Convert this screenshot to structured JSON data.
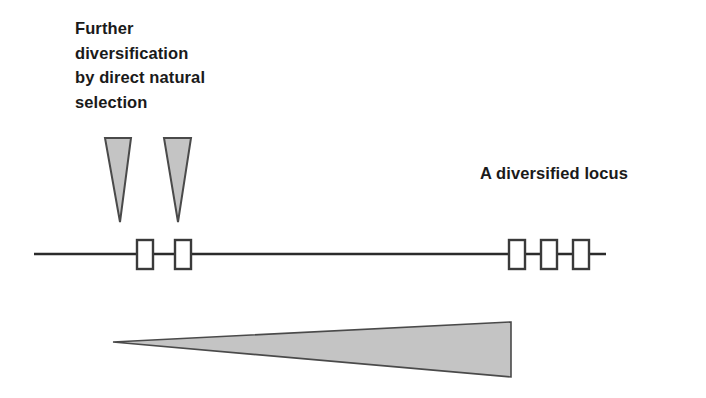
{
  "figure": {
    "width": 706,
    "height": 398,
    "background_color": "#ffffff",
    "type": "schematic-diagram"
  },
  "labels": {
    "left_caption": "Further\ndiversification\nby direct natural\nselection",
    "left_caption_lines": [
      "Further",
      "diversification",
      "by direct natural",
      "selection"
    ],
    "right_caption": "A diversified locus"
  },
  "colors": {
    "text": "#1a1a1a",
    "line": "#2b2b2b",
    "triangle_fill": "#c4c4c4",
    "triangle_stroke": "#4a4a4a",
    "box_fill": "#ffffff",
    "box_stroke": "#3a3a3a"
  },
  "diagram": {
    "chromosome_line": {
      "x1": 34,
      "x2": 606,
      "y": 254,
      "stroke_width": 2.6
    },
    "gene_boxes": [
      {
        "name": "locus-box-left-1",
        "x": 137,
        "y": 240,
        "width": 16,
        "height": 29
      },
      {
        "name": "locus-box-left-2",
        "x": 175,
        "y": 240,
        "width": 16,
        "height": 29
      },
      {
        "name": "locus-box-right-1",
        "x": 509,
        "y": 240,
        "width": 16,
        "height": 29
      },
      {
        "name": "locus-box-right-2",
        "x": 541,
        "y": 240,
        "width": 16,
        "height": 29
      },
      {
        "name": "locus-box-right-3",
        "x": 573,
        "y": 240,
        "width": 16,
        "height": 29
      }
    ],
    "selection_arrows": [
      {
        "name": "selection-triangle-1",
        "top_left_x": 105,
        "top_right_x": 131,
        "top_y": 138,
        "tip_x": 120,
        "tip_y": 222
      },
      {
        "name": "selection-triangle-2",
        "top_left_x": 164,
        "top_right_x": 191,
        "top_y": 138,
        "tip_x": 178,
        "tip_y": 222
      }
    ],
    "divergence_wedge": {
      "name": "divergence-wedge",
      "apex_x": 113,
      "apex_y": 342,
      "base_x": 511,
      "base_top_y": 322,
      "base_bottom_y": 377
    }
  }
}
